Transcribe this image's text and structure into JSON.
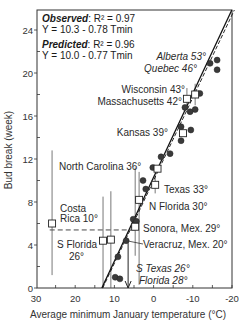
{
  "chart_data": {
    "type": "scatter",
    "title": "",
    "xlabel": "Average minimum January temperature  (°C)",
    "ylabel": "Bud break (week)",
    "xlim": [
      30,
      -20
    ],
    "ylim": [
      0,
      25.5
    ],
    "x_ticks": [
      30,
      20,
      10,
      0,
      -10,
      -20
    ],
    "x_tick_labels": [
      "30",
      "20",
      "10",
      "0",
      "-10",
      "-20"
    ],
    "y_ticks": [
      0,
      4,
      8,
      12,
      16,
      20,
      24
    ],
    "y_tick_labels": [
      "0",
      "4",
      "8",
      "12",
      "16",
      "20",
      "24"
    ],
    "grid": false,
    "legend": {
      "placement": "top-left",
      "observed_label": "Observed",
      "observed_r2": ": R² = 0.97",
      "observed_eq": "Y = 10.3 - 0.78 Tmin",
      "predicted_label": "Predicted",
      "predicted_r2": ":  R² = 0.96",
      "predicted_eq": "Y = 10.0 - 0.77 Tmin"
    },
    "regression_lines": [
      {
        "name": "Observed",
        "intercept": 10.3,
        "slope": -0.78,
        "style": "solid"
      },
      {
        "name": "Predicted",
        "intercept": 10.0,
        "slope": -0.77,
        "style": "dashed"
      }
    ],
    "series": [
      {
        "name": "Observed",
        "marker": "filled-circle",
        "points": [
          {
            "x": -14.4,
            "y": 20.9
          },
          {
            "x": -16.2,
            "y": 21.2
          },
          {
            "x": -16.2,
            "y": 20.3
          },
          {
            "x": -11.8,
            "y": 18.1
          },
          {
            "x": -8.0,
            "y": 16.8
          },
          {
            "x": -10.6,
            "y": 16.6
          },
          {
            "x": -9.3,
            "y": 16.4
          },
          {
            "x": -7.0,
            "y": 15.0
          },
          {
            "x": -9.5,
            "y": 14.7
          },
          {
            "x": -7.0,
            "y": 13.7
          },
          {
            "x": -1.9,
            "y": 12.2
          },
          {
            "x": -4.2,
            "y": 12.5
          },
          {
            "x": 0.2,
            "y": 11.2
          },
          {
            "x": 2.7,
            "y": 10.0
          },
          {
            "x": 2.0,
            "y": 9.2
          },
          {
            "x": 5.2,
            "y": 6.4
          },
          {
            "x": 4.4,
            "y": 6.2
          },
          {
            "x": 7.0,
            "y": 4.4
          },
          {
            "x": 9.1,
            "y": 2.9
          },
          {
            "x": 9.8,
            "y": 1.0
          },
          {
            "x": 8.6,
            "y": 0.85
          }
        ]
      },
      {
        "name": "Predicted",
        "marker": "open-square",
        "points": [
          {
            "x": -10.6,
            "y": 18.0,
            "err_hi": 19.0,
            "err_lo": 17.0
          },
          {
            "x": -8.5,
            "y": 17.6,
            "err_hi": 18.6,
            "err_lo": 16.6
          },
          {
            "x": -7.5,
            "y": 14.4
          },
          {
            "x": -1.0,
            "y": 11.1
          },
          {
            "x": -0.4,
            "y": 9.6,
            "err_hi": 10.5,
            "err_lo": 8.8
          },
          {
            "x": 3.7,
            "y": 8.2,
            "err_hi": 10.8,
            "err_lo": 0.3
          },
          {
            "x": 4.7,
            "y": 5.7,
            "err_hi": 11.2,
            "err_lo": 3.0
          },
          {
            "x": 10.9,
            "y": 4.5,
            "err_hi": 9.0,
            "err_lo": 0.0
          },
          {
            "x": 12.9,
            "y": 4.4,
            "err_hi": 8.5,
            "err_lo": 0.0
          },
          {
            "x": 25.9,
            "y": 6.0,
            "err_hi": 12.8,
            "err_lo": 1.2
          }
        ]
      }
    ],
    "reference_lines": [
      {
        "type": "horizontal-dashed",
        "y": 5.4,
        "x_from": 26.5,
        "x_to": 4.5
      }
    ],
    "arrow": {
      "x": 6.5,
      "y_from": 2.5,
      "y_to": 0.0
    },
    "annotations": [
      {
        "text": "Alberta  53°",
        "italic": true
      },
      {
        "text": "Quebec 46°",
        "italic": true
      },
      {
        "text": "Wisconsin 43°",
        "italic": false
      },
      {
        "text": "Massachusetts 42°",
        "italic": false
      },
      {
        "text": "Kansas 39°",
        "italic": false
      },
      {
        "text": "North Carolina 36°",
        "italic": false
      },
      {
        "text": "Texas 33°",
        "italic": false
      },
      {
        "text": "N Florida 30°",
        "italic": false
      },
      {
        "text": "Costa",
        "italic": false
      },
      {
        "text": "Rica 10°",
        "italic": false
      },
      {
        "text": "Sonora, Mex. 29°",
        "italic": false
      },
      {
        "text": "S Florida",
        "italic": false
      },
      {
        "text": "26°",
        "italic": false
      },
      {
        "text": "Veracruz, Mex. 20°",
        "italic": false
      },
      {
        "text": "S Texas 26°",
        "italic": true
      },
      {
        "text": "Florida 28°",
        "italic": true
      }
    ]
  }
}
